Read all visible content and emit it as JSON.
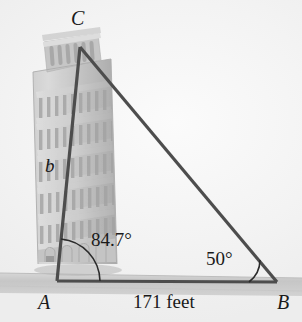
{
  "figure": {
    "vertices": {
      "C": {
        "label": "C",
        "x": 80,
        "y": 47
      },
      "A": {
        "label": "A",
        "x": 57,
        "y": 281
      },
      "B": {
        "label": "B",
        "x": 277,
        "y": 282
      }
    },
    "sides": {
      "b": {
        "label": "b",
        "description": "side from A to C, the tower height"
      },
      "base": {
        "label": "171 feet",
        "value": 171,
        "unit": "feet",
        "description": "side from A to B along the ground"
      }
    },
    "angles": {
      "at_A": {
        "label": "84.7°",
        "value": 84.7,
        "unit": "degrees"
      },
      "at_B": {
        "label": "50°",
        "value": 50,
        "unit": "degrees"
      }
    },
    "colors": {
      "background": "#f2f2f2",
      "line": "#4d4d4d",
      "ground": "#c9c9c9",
      "tower": "#b9b9b9",
      "text": "#1a1a1a"
    },
    "illustration": {
      "subject": "leaning-tower-of-pisa",
      "tier_count": 7,
      "leaning": true
    }
  }
}
